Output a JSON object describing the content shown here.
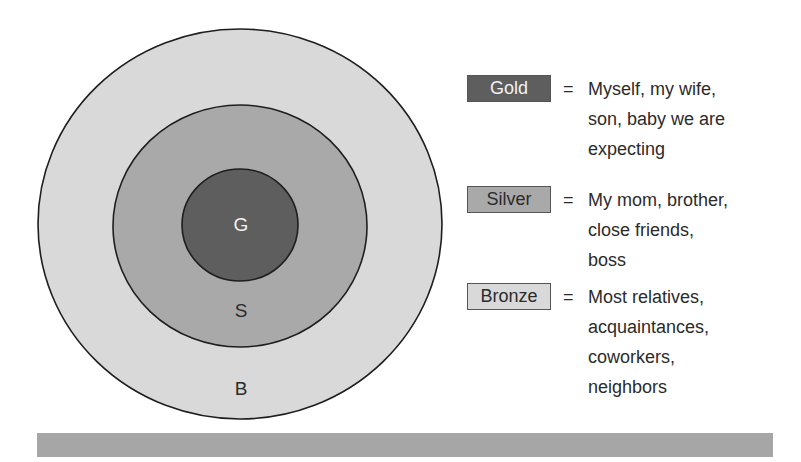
{
  "colors": {
    "gold": "#5e5e5e",
    "silver": "#a9a9a9",
    "bronze": "#d9d9d9",
    "outline": "#1e1e1e",
    "bar": "#a6a6a6",
    "gold_text": "#f2f2f2",
    "dark_text": "#2b2b2b"
  },
  "rings": {
    "gold_label": "G",
    "silver_label": "S",
    "bronze_label": "B"
  },
  "legend": {
    "equals": "=",
    "items": [
      {
        "key": "Gold",
        "lines": [
          "Myself, my wife,",
          "son, baby we are",
          "expecting"
        ]
      },
      {
        "key": "Silver",
        "lines": [
          "My mom, brother,",
          "close friends,",
          "boss"
        ]
      },
      {
        "key": "Bronze",
        "lines": [
          "Most relatives,",
          "acquaintances,",
          "coworkers,",
          "neighbors"
        ]
      }
    ]
  }
}
